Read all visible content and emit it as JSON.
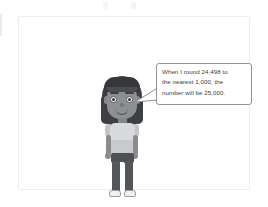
{
  "scene": {
    "background_color": "#ffffff",
    "frame_border_color": "#eceef0"
  },
  "speech_bubble": {
    "text": "When I round 24,498 to\nthe nearest 1,000, the\nnumber will be 25,000.",
    "lines": [
      "When I round 24,498 to",
      "the nearest 1,000, the",
      "number will be 25,000."
    ],
    "border_color": "#8d9095",
    "fill_color": "#ffffff",
    "text_color": "#3b3d40",
    "tail_direction": "down-left"
  },
  "character": {
    "description": "cartoon avatar of a person standing",
    "hair_color": "#3d3f42",
    "skin_color": "#8e8f92",
    "shirt_color": "#d9dadc",
    "pants_color": "#54575a",
    "shoe_color": "#f0f0f1",
    "expression": "smiling"
  }
}
